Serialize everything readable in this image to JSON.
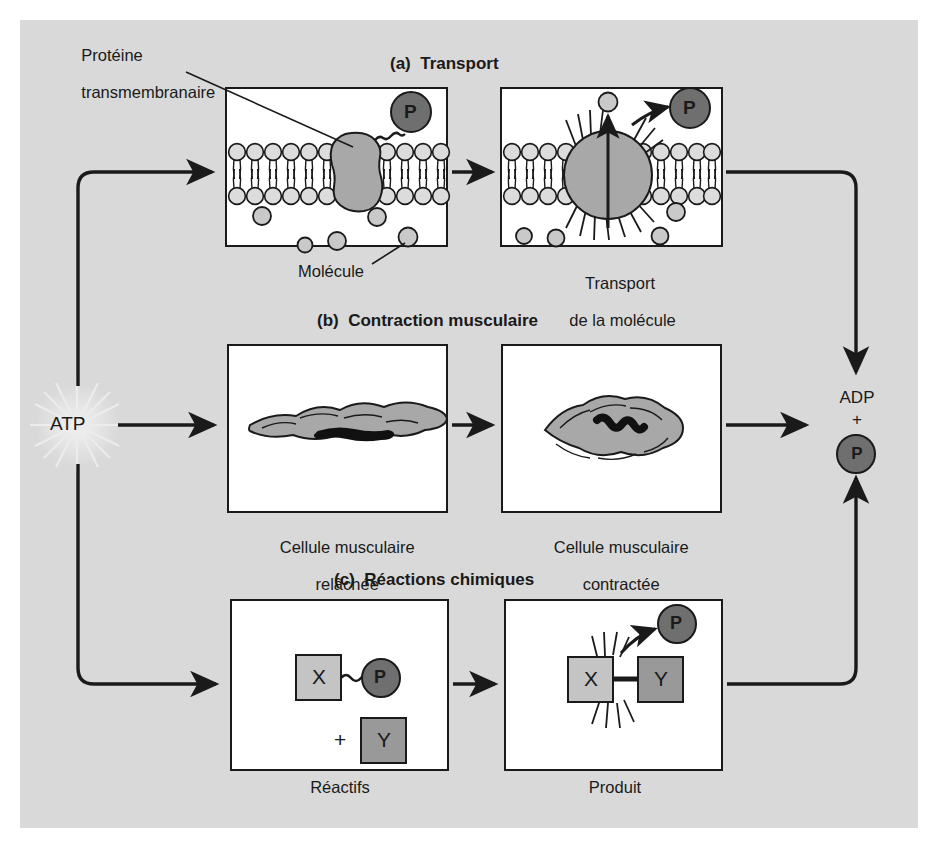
{
  "figure": {
    "type": "diagram",
    "language": "fr",
    "background_color": "#d9d9d9",
    "panel_fill": "#ffffff",
    "ink_color": "#1a1a1a",
    "phosphate_color": "#6f6f6f",
    "protein_color": "#a8a8a8",
    "molecule_color": "#c9c9c9",
    "x_block_color": "#c4c4c4",
    "y_block_color": "#999999"
  },
  "energy": {
    "source_label": "ATP",
    "product_label": "ADP",
    "plus_label": "+",
    "phosphate_label": "P"
  },
  "sections": [
    {
      "id": "a",
      "header": "(a)  Transport",
      "left_panel": {
        "caption": "",
        "annotation_top": "Protéine\ntransmembranaire",
        "annotation_bottom": "Molécule",
        "phosphate_label": "P"
      },
      "right_panel": {
        "caption": "Transport\nde la molécule",
        "phosphate_label": "P"
      }
    },
    {
      "id": "b",
      "header": "(b)  Contraction musculaire",
      "left_panel": {
        "caption": "Cellule musculaire\nrelâchée"
      },
      "right_panel": {
        "caption": "Cellule musculaire\ncontractée"
      }
    },
    {
      "id": "c",
      "header": "(c)  Réactions chimiques",
      "left_panel": {
        "caption": "Réactifs",
        "block_x": "X",
        "block_y": "Y",
        "plus": "+",
        "phosphate_label": "P"
      },
      "right_panel": {
        "caption": "Produit",
        "block_x": "X",
        "block_y": "Y",
        "phosphate_label": "P"
      }
    }
  ],
  "labels": {
    "protein_line1": "Protéine",
    "protein_line2": "transmembranaire",
    "molecule": "Molécule",
    "transport_line1": "Transport",
    "transport_line2": "de la molécule",
    "relaxed_line1": "Cellule musculaire",
    "relaxed_line2": "relâchée",
    "contracted_line1": "Cellule musculaire",
    "contracted_line2": "contractée",
    "reactifs": "Réactifs",
    "produit": "Produit",
    "header_a": "(a)  Transport",
    "header_b": "(b)  Contraction musculaire",
    "header_c": "(c)  Réactions chimiques",
    "block_x_a": "X",
    "block_y_a": "Y",
    "plus_a": "+",
    "block_x_b": "X",
    "block_y_b": "Y",
    "p_a_left": "P",
    "p_a_right": "P",
    "p_c_left": "P",
    "p_c_right": "P",
    "atp": "ATP",
    "adp": "ADP",
    "adp_plus": "+",
    "adp_p": "P"
  }
}
